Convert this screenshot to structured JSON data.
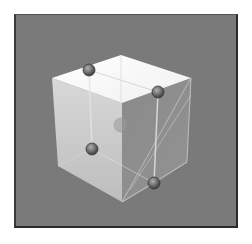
{
  "viewport": {
    "label": "3D viewport",
    "background_color": "#7a7a7a",
    "frame_color": "#2a2a2a"
  },
  "object": {
    "name": "cube",
    "faces": {
      "top": {
        "color": "#f8f8f8",
        "points": "52,78 121,55 191,78 122,103"
      },
      "left": {
        "color": "#c8c8c8",
        "points": "52,78 122,103 122,202 58,166"
      },
      "right": {
        "color": "#8e8e8e",
        "points": "122,103 191,78 187,162 122,202"
      }
    },
    "edge_color": "#e6e6e6"
  },
  "handles": [
    {
      "name": "handle-top-left",
      "x": 89,
      "y": 70,
      "r": 6
    },
    {
      "name": "handle-top-right",
      "x": 158,
      "y": 92,
      "r": 6
    },
    {
      "name": "handle-bottom-left",
      "x": 92,
      "y": 149,
      "r": 6
    },
    {
      "name": "handle-bottom-right",
      "x": 154,
      "y": 183,
      "r": 6
    },
    {
      "name": "handle-center",
      "x": 121,
      "y": 125,
      "r": 7,
      "faint": true
    }
  ],
  "handle_color": "#6e6e6e"
}
